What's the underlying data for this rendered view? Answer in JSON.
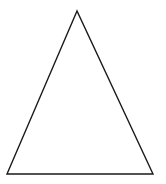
{
  "canvas": {
    "width": 166,
    "height": 184,
    "background": "#ffffff"
  },
  "shape": {
    "type": "triangle",
    "kind": "isosceles",
    "points": "77,11 7,174 153,174",
    "stroke": "#1a1a1a",
    "stroke_width": 1.4,
    "fill": "none"
  }
}
